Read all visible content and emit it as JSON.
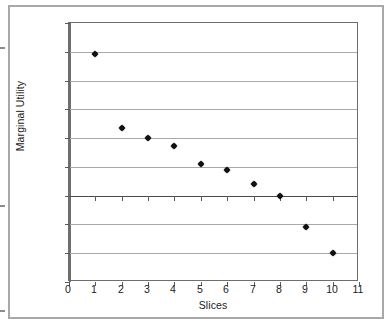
{
  "chart_data": {
    "type": "scatter",
    "title": "",
    "xlabel": "Slices",
    "ylabel": "Marginal Utility",
    "x": [
      1,
      2,
      3,
      4,
      5,
      6,
      7,
      8,
      9,
      10
    ],
    "values": [
      24.6,
      11.8,
      10.0,
      8.7,
      5.5,
      4.4,
      2.1,
      0.0,
      -5.4,
      -10.0
    ],
    "series": [
      {
        "name": "Marginal Utility",
        "values": [
          24.6,
          11.8,
          10.0,
          8.7,
          5.5,
          4.4,
          2.1,
          0.0,
          -5.4,
          -10.0
        ]
      }
    ],
    "xlim": [
      0,
      11
    ],
    "ylim": [
      -15,
      30
    ],
    "xticks": [
      "0",
      "1",
      "2",
      "3",
      "4",
      "5",
      "6",
      "7",
      "8",
      "9",
      "10",
      "11"
    ],
    "yticks": [
      "30",
      "25",
      "20",
      "15",
      "10",
      "5",
      "0",
      "-5",
      "-10",
      "-15"
    ],
    "ytick_values": [
      30,
      25,
      20,
      15,
      10,
      5,
      0,
      -5,
      -10,
      -15
    ],
    "grid": true,
    "grid_axis": "y",
    "legend": false,
    "marker": "diamond",
    "marker_color": "#111111"
  },
  "axes": {
    "y_title": "Marginal Utility",
    "x_title": "Slices"
  }
}
